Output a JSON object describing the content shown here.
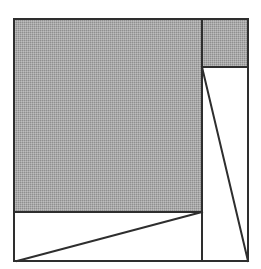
{
  "diagram": {
    "colors": {
      "background": "#ffffff",
      "stroke": "#2e2e2e",
      "shade": "#a9a9a9",
      "shade_dot": "#8f8f8f"
    },
    "outer_square": {
      "x": 14,
      "y": 19,
      "w": 234,
      "h": 242
    },
    "shaded_squares": [
      {
        "name": "large-square",
        "x": 14,
        "y": 19,
        "w": 188,
        "h": 193
      },
      {
        "name": "small-square",
        "x": 202,
        "y": 19,
        "w": 46,
        "h": 48
      }
    ],
    "lines": [
      {
        "name": "vertical-divider",
        "x1": 202,
        "y1": 19,
        "x2": 202,
        "y2": 261
      },
      {
        "name": "small-square-bottom",
        "x1": 202,
        "y1": 67,
        "x2": 248,
        "y2": 67
      },
      {
        "name": "large-square-bottom",
        "x1": 14,
        "y1": 212,
        "x2": 202,
        "y2": 212
      },
      {
        "name": "right-diagonal",
        "x1": 202,
        "y1": 67,
        "x2": 248,
        "y2": 261
      },
      {
        "name": "bottom-diagonal",
        "x1": 17,
        "y1": 261,
        "x2": 202,
        "y2": 212
      }
    ]
  }
}
